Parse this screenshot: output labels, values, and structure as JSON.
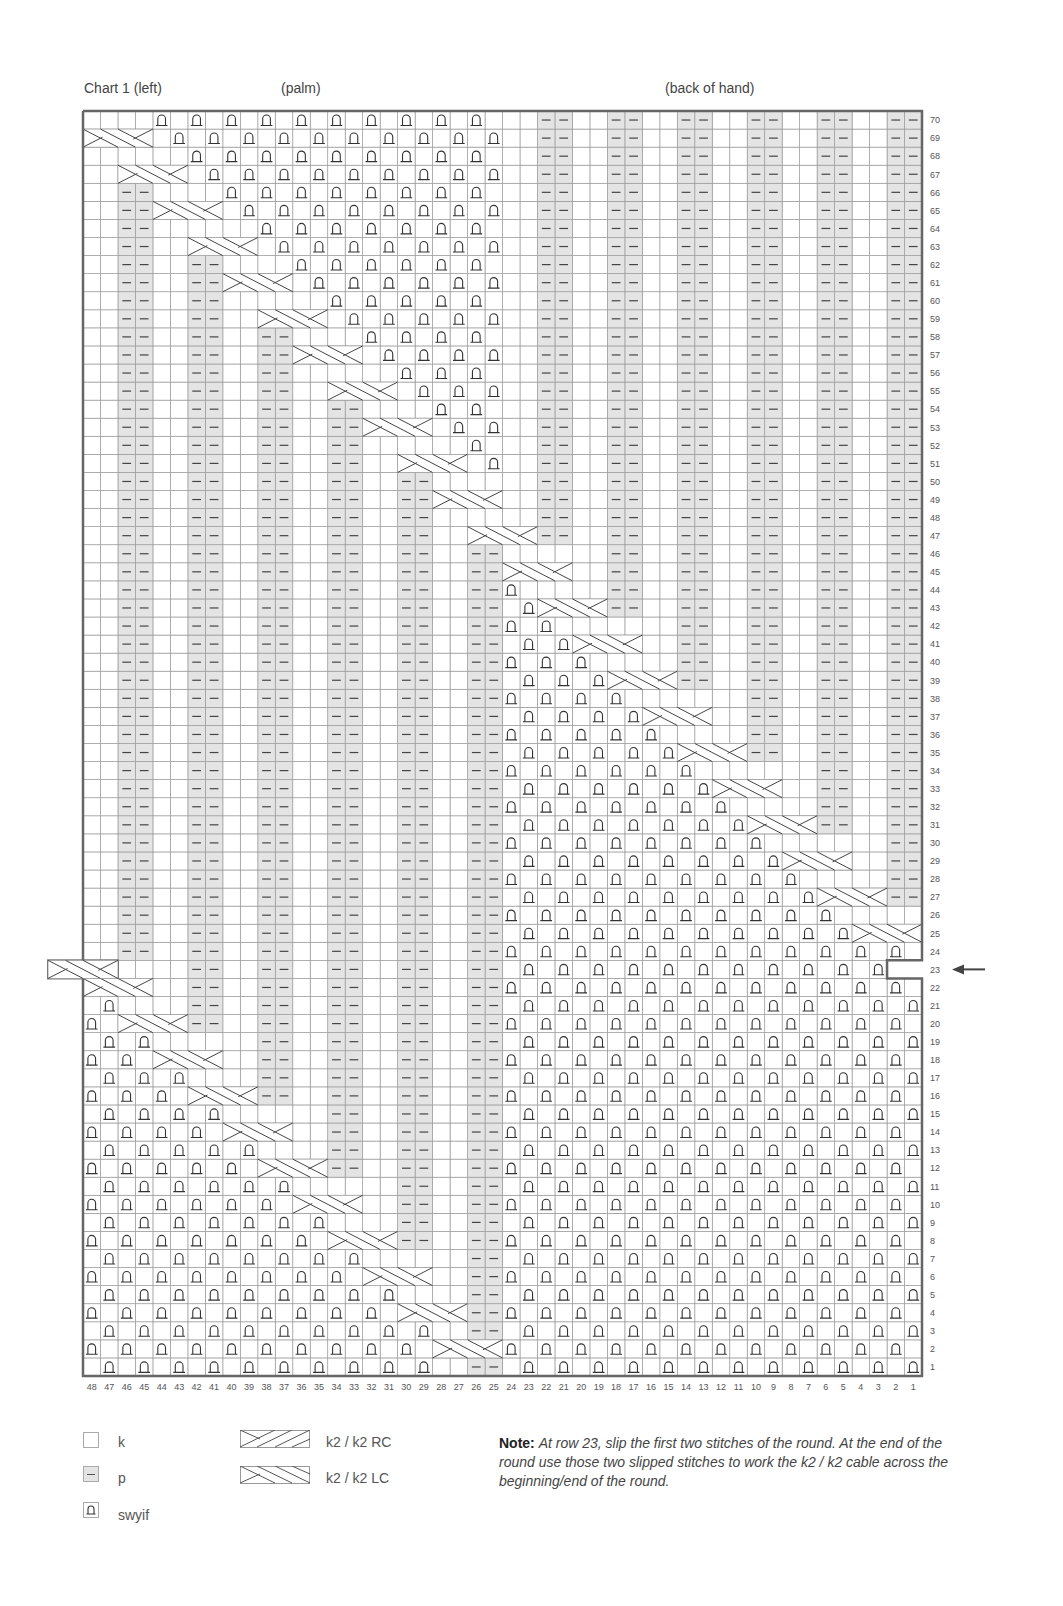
{
  "header": {
    "chart_title": "Chart 1 (left)",
    "section_left": "(palm)",
    "section_right": "(back of hand)"
  },
  "grid": {
    "columns": 48,
    "rows": 70,
    "column_labels": [
      "48",
      "47",
      "46",
      "45",
      "44",
      "43",
      "42",
      "41",
      "40",
      "39",
      "38",
      "37",
      "36",
      "35",
      "34",
      "33",
      "32",
      "31",
      "30",
      "29",
      "28",
      "27",
      "26",
      "25",
      "24",
      "23",
      "22",
      "21",
      "20",
      "19",
      "18",
      "17",
      "16",
      "15",
      "14",
      "13",
      "12",
      "11",
      "10",
      "9",
      "8",
      "7",
      "6",
      "5",
      "4",
      "3",
      "2",
      "1"
    ],
    "marked_row": "23",
    "colors": {
      "purl_fill": "#e4e4e4",
      "grid_line": "#9a9a9a",
      "border": "#666666",
      "symbol": "#333333"
    }
  },
  "legend": {
    "items": [
      {
        "symbol": "knit-box",
        "label": "k"
      },
      {
        "symbol": "purl-box",
        "label": "p"
      },
      {
        "symbol": "swyif-box",
        "label": "swyif"
      },
      {
        "symbol": "cable-rc",
        "label": "k2 / k2 RC"
      },
      {
        "symbol": "cable-lc",
        "label": "k2 / k2 LC"
      }
    ]
  },
  "note": {
    "heading": "Note:",
    "text": "At row 23, slip the first two stitches of the round.  At the end of the round use those two slipped stitches to work the k2 / k2 cable across the beginning/end of the round."
  },
  "chart_data": {
    "type": "table",
    "title": "Chart 1 (left)",
    "annotations": [
      "(palm)",
      "(back of hand)"
    ],
    "xlabel": "stitch (48 → 1)",
    "ylabel": "round (1 → 70)",
    "legend": [
      "k",
      "p",
      "swyif",
      "k2 / k2 RC",
      "k2 / k2 LC"
    ],
    "purl_pair_columns": [
      [
        1,
        2
      ],
      [
        5,
        6
      ],
      [
        9,
        10
      ],
      [
        13,
        14
      ],
      [
        17,
        18
      ],
      [
        21,
        22
      ],
      [
        25,
        26
      ],
      [
        29,
        30
      ],
      [
        33,
        34
      ],
      [
        37,
        38
      ],
      [
        41,
        42
      ],
      [
        45,
        46
      ]
    ],
    "cable_path_note": "Single diagonal k2/k2 cable travels from stitch 28-25 at round 1 up-left through round 70 at stitches 48-45; swyif checkerboard fills on the trailing side; row 23 wraps across the round boundary.",
    "special_row": 23
  }
}
